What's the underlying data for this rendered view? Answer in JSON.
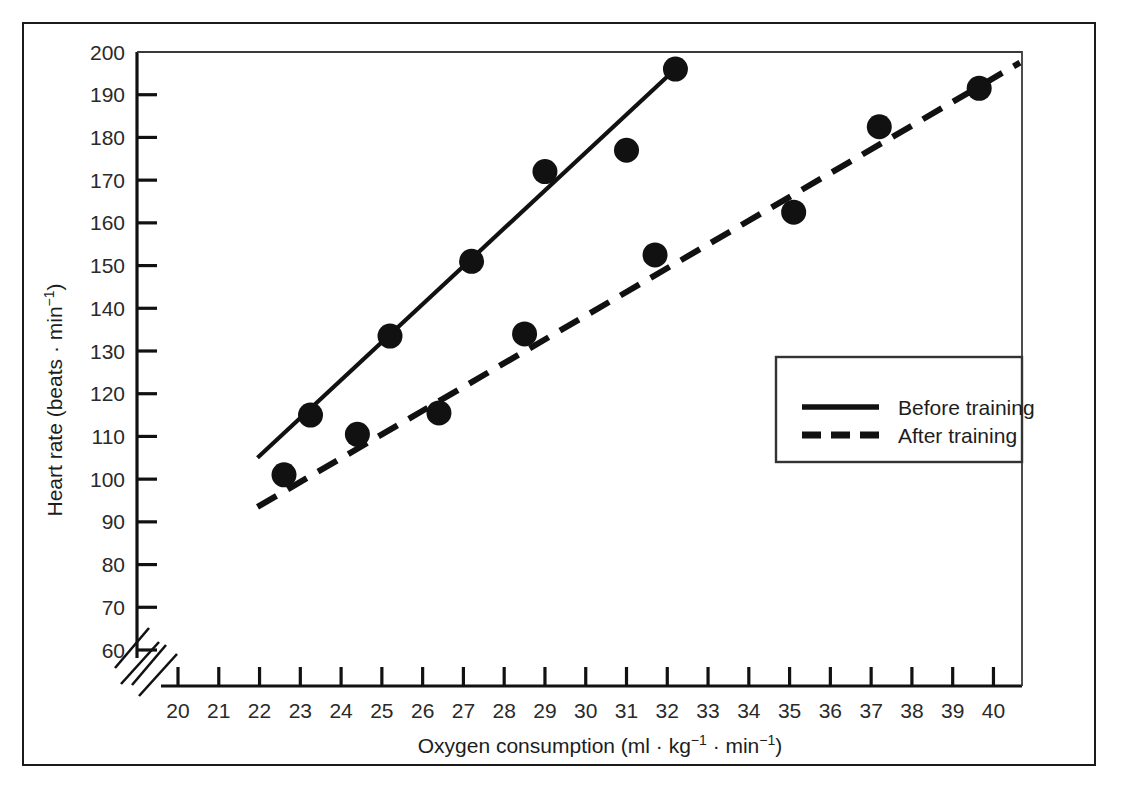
{
  "figure": {
    "background_color": "#ffffff",
    "frame_color": "#1b1b1b",
    "ink_color": "#111111"
  },
  "chart_data": {
    "type": "scatter",
    "title": "",
    "xlabel": "Oxygen consumption (ml · kg⁻¹ · min⁻¹)",
    "ylabel": "Heart rate (beats · min⁻¹)",
    "xlim": [
      20,
      40.7
    ],
    "ylim": [
      60,
      200
    ],
    "xticks": [
      20,
      21,
      22,
      23,
      24,
      25,
      26,
      27,
      28,
      29,
      30,
      31,
      32,
      33,
      34,
      35,
      36,
      37,
      38,
      39,
      40
    ],
    "yticks": [
      60,
      70,
      80,
      90,
      100,
      110,
      120,
      130,
      140,
      150,
      160,
      170,
      180,
      190,
      200
    ],
    "xtick_labels": [
      "20",
      "21",
      "22",
      "23",
      "24",
      "25",
      "26",
      "27",
      "28",
      "29",
      "30",
      "31",
      "32",
      "33",
      "34",
      "35",
      "36",
      "37",
      "38",
      "39",
      "40"
    ],
    "ytick_labels": [
      "60",
      "70",
      "80",
      "90",
      "100",
      "110",
      "120",
      "130",
      "140",
      "150",
      "160",
      "170",
      "180",
      "190",
      "200"
    ],
    "grid": false,
    "axis_break": true,
    "legend_position": "lower right",
    "series": [
      {
        "name": "Before training",
        "style": "solid",
        "marker": "filled-circle",
        "points": [
          {
            "x": 22.6,
            "y": 101
          },
          {
            "x": 23.25,
            "y": 115
          },
          {
            "x": 25.2,
            "y": 133.5
          },
          {
            "x": 27.2,
            "y": 151
          },
          {
            "x": 29.0,
            "y": 172
          },
          {
            "x": 31.0,
            "y": 177
          },
          {
            "x": 32.2,
            "y": 196
          }
        ],
        "fit_line": {
          "x1": 21.95,
          "y1": 105,
          "x2": 32.2,
          "y2": 196
        }
      },
      {
        "name": "After training",
        "style": "dashed",
        "marker": "filled-circle",
        "points": [
          {
            "x": 24.4,
            "y": 110.5
          },
          {
            "x": 26.4,
            "y": 115.5
          },
          {
            "x": 28.5,
            "y": 134
          },
          {
            "x": 31.7,
            "y": 152.5
          },
          {
            "x": 35.1,
            "y": 162.5
          },
          {
            "x": 37.2,
            "y": 182.5
          },
          {
            "x": 39.65,
            "y": 191.5
          }
        ],
        "fit_line": {
          "x1": 21.95,
          "y1": 93.5,
          "x2": 40.65,
          "y2": 197.5
        }
      }
    ]
  },
  "legend": {
    "items": [
      {
        "label": "Before training",
        "style": "solid"
      },
      {
        "label": "After training",
        "style": "dashed"
      }
    ]
  }
}
